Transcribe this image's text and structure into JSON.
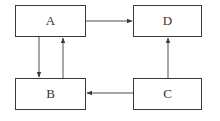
{
  "diagram": {
    "nodes": [
      {
        "id": "A",
        "label": "A",
        "x": 15,
        "y": 5,
        "w": 71,
        "h": 32
      },
      {
        "id": "D",
        "label": "D",
        "x": 133,
        "y": 5,
        "w": 69,
        "h": 32
      },
      {
        "id": "B",
        "label": "B",
        "x": 15,
        "y": 78,
        "w": 71,
        "h": 32
      },
      {
        "id": "C",
        "label": "C",
        "x": 133,
        "y": 78,
        "w": 69,
        "h": 32
      }
    ],
    "edges": [
      {
        "from": "A",
        "to": "D"
      },
      {
        "from": "A",
        "to": "B"
      },
      {
        "from": "B",
        "to": "A"
      },
      {
        "from": "C",
        "to": "B"
      },
      {
        "from": "C",
        "to": "D"
      }
    ],
    "colors": {
      "line": "#3a3a3a",
      "background": "#ffffff"
    }
  }
}
